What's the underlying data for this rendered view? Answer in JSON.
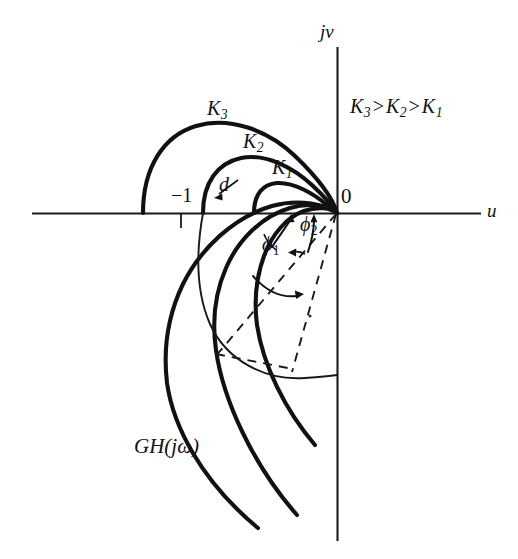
{
  "figure": {
    "kind": "nyquist-plot",
    "background_color": "#ffffff",
    "ink_color": "#111111",
    "width": 518,
    "height": 559
  },
  "axes": {
    "imaginary_axis_label": "jv",
    "real_axis_label": "u",
    "origin_label": "0",
    "origin_px": {
      "x": 337,
      "y": 213
    },
    "real_axis_span_px": {
      "x1": 33,
      "x2": 480,
      "y": 213
    },
    "imag_axis_span_px": {
      "x": 337,
      "y1": 48,
      "y2": 540
    }
  },
  "annotations": {
    "gain_ordering": {
      "text": "K3 > K2 > K1",
      "parts": {
        "k3": "K",
        "k3_sub": "3",
        "op1": ">",
        "k2": "K",
        "k2_sub": "2",
        "op2": ">",
        "k1": "K",
        "k1_sub": "1"
      }
    },
    "critical_point": "−1",
    "distance_marker": "d",
    "phase_margin_1": {
      "base": "ϕ",
      "sub": "1"
    },
    "phase_margin_2": {
      "base": "ϕ",
      "sub": "2"
    },
    "transfer_function": {
      "gh": "GH",
      "open_paren": "(",
      "j": "j",
      "omega": "ω",
      "close_paren": ")"
    }
  },
  "curves": [
    {
      "name": "K3",
      "label": "K",
      "label_sub": "3",
      "stroke_width": 4.1,
      "real_axis_crossing_px": {
        "x": 143,
        "y": 213
      },
      "apex_px": {
        "x": 215,
        "y": 125
      },
      "tail_end_px": {
        "x": 258,
        "y": 528
      }
    },
    {
      "name": "K2",
      "label": "K",
      "label_sub": "2",
      "stroke_width": 4.1,
      "real_axis_crossing_px": {
        "x": 203,
        "y": 213
      },
      "apex_px": {
        "x": 250,
        "y": 158
      },
      "tail_end_px": {
        "x": 297,
        "y": 515
      }
    },
    {
      "name": "K1",
      "label": "K",
      "label_sub": "1",
      "stroke_width": 4.1,
      "real_axis_crossing_px": {
        "x": 254,
        "y": 213
      },
      "apex_px": {
        "x": 278,
        "y": 183
      },
      "tail_end_px": {
        "x": 315,
        "y": 445
      }
    }
  ],
  "constant_m_arc": {
    "name": "thin-arc",
    "stroke_width": 1.9,
    "start_px": {
      "x": 203,
      "y": 213
    },
    "end_px": {
      "x": 337,
      "y": 375
    }
  },
  "dashed_rays": [
    {
      "name": "ray-phi1",
      "from_px": {
        "x": 337,
        "y": 213
      },
      "to_px": {
        "x": 218,
        "y": 353
      }
    },
    {
      "name": "ray-phi2",
      "from_px": {
        "x": 337,
        "y": 213
      },
      "to_px": {
        "x": 293,
        "y": 368
      }
    },
    {
      "name": "chord",
      "from_px": {
        "x": 218,
        "y": 353
      },
      "to_px": {
        "x": 293,
        "y": 368
      }
    }
  ]
}
